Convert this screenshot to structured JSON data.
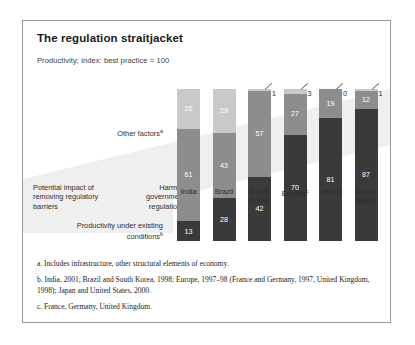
{
  "figure": {
    "title": "The regulation straitjacket",
    "subtitle": "Productivity; index: best practice = 100"
  },
  "labels": {
    "other_factors": "Other factors",
    "other_factors_sup": "a",
    "potential_impact": "Potential impact of removing regulatory barriers",
    "harmful_regulations": "Harmful government regulations",
    "productivity_under": "Productivity under existing conditions",
    "productivity_sup": "b"
  },
  "notes": [
    "a. Includes infrastructure, other structural elements of economy.",
    "b. India, 2001; Brazil and South Korea, 1998; Europe, 1997–98 (France and Germany, 1997, United Kingdom, 1998); Japan and United States, 2000.",
    "c. France, Germany, United Kingdom."
  ],
  "colors": {
    "productivity": "#3a3a3a",
    "harmful": "#8d8d8d",
    "other": "#c9c9c9",
    "band": "#eeeeee",
    "frame": "#9a9a9a"
  },
  "chart_data": {
    "type": "bar",
    "title": "The regulation straitjacket",
    "subtitle": "Productivity; index: best practice = 100",
    "xlabel": "",
    "ylabel": "Productivity index (best practice = 100)",
    "ylim": [
      0,
      100
    ],
    "stacked": true,
    "grid": false,
    "legend": "left-side annotations",
    "categories": [
      "India",
      "Brazil",
      "South Korea",
      "Europe",
      "Japan",
      "United States"
    ],
    "category_labels": [
      {
        "line1": "India",
        "line2": "",
        "sup": ""
      },
      {
        "line1": "Brazil",
        "line2": "",
        "sup": ""
      },
      {
        "line1": "South",
        "line2": "Korea",
        "sup": ""
      },
      {
        "line1": "Europe",
        "line2": "",
        "sup": "c"
      },
      {
        "line1": "Japan",
        "line2": "",
        "sup": ""
      },
      {
        "line1": "United",
        "line2": "States",
        "sup": ""
      }
    ],
    "series": [
      {
        "name": "Productivity under existing conditions",
        "color": "#3a3a3a",
        "values": [
          13,
          28,
          42,
          70,
          81,
          87
        ]
      },
      {
        "name": "Harmful government regulations",
        "color": "#8d8d8d",
        "values": [
          61,
          43,
          57,
          27,
          19,
          12
        ]
      },
      {
        "name": "Other factors",
        "color": "#c9c9c9",
        "values": [
          26,
          29,
          1,
          3,
          0,
          1
        ]
      }
    ],
    "callouts": [
      {
        "category": "South Korea",
        "value": "1"
      },
      {
        "category": "Europe",
        "value": "3"
      },
      {
        "category": "Japan",
        "value": "0"
      },
      {
        "category": "United States",
        "value": "1"
      }
    ]
  }
}
